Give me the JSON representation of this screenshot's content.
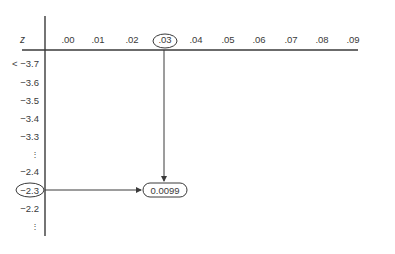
{
  "table": {
    "corner_label": "z",
    "column_headers": [
      ".00",
      ".01",
      ".02",
      ".03",
      ".04",
      ".05",
      ".06",
      ".07",
      ".08",
      ".09"
    ],
    "row_labels": [
      {
        "label": "< −3.7",
        "type": "value"
      },
      {
        "label": "−3.6",
        "type": "value"
      },
      {
        "label": "−3.5",
        "type": "value"
      },
      {
        "label": "−3.4",
        "type": "value"
      },
      {
        "label": "−3.3",
        "type": "value"
      },
      {
        "label": "⋮",
        "type": "ellipsis"
      },
      {
        "label": "−2.4",
        "type": "value"
      },
      {
        "label": "−2.3",
        "type": "value"
      },
      {
        "label": "−2.2",
        "type": "value"
      },
      {
        "label": "⋮",
        "type": "ellipsis"
      }
    ]
  },
  "highlight": {
    "column": ".03",
    "row": "−2.3",
    "value": "0.0099"
  },
  "colors": {
    "line": "#3a3a3a",
    "text": "#3a3a3a",
    "background": "#ffffff"
  }
}
